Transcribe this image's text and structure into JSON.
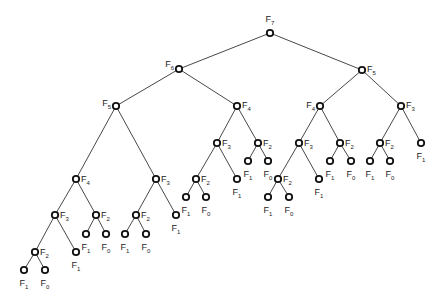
{
  "diagram": {
    "title": "",
    "type": "recursion-tree",
    "colors": {
      "edge": "#333333",
      "node_stroke": "#111111",
      "node_fill": "#ffffff",
      "label": "#222222"
    },
    "nodes": [
      {
        "id": "n0",
        "label": "F",
        "sub": "7",
        "x": 270,
        "y": 33,
        "lx": 270,
        "ly": 22,
        "anchor": "middle"
      },
      {
        "id": "n1",
        "label": "F",
        "sub": "6",
        "x": 179,
        "y": 69,
        "lx": 174,
        "ly": 67,
        "anchor": "end"
      },
      {
        "id": "n2",
        "label": "F",
        "sub": "5",
        "x": 362,
        "y": 70,
        "lx": 367,
        "ly": 72,
        "anchor": "start"
      },
      {
        "id": "n3",
        "label": "F",
        "sub": "5",
        "x": 116,
        "y": 106,
        "lx": 111,
        "ly": 106,
        "anchor": "end"
      },
      {
        "id": "n4",
        "label": "F",
        "sub": "4",
        "x": 237,
        "y": 106,
        "lx": 242,
        "ly": 108,
        "anchor": "start"
      },
      {
        "id": "n5",
        "label": "F",
        "sub": "4",
        "x": 320,
        "y": 106,
        "lx": 315,
        "ly": 108,
        "anchor": "end"
      },
      {
        "id": "n6",
        "label": "F",
        "sub": "3",
        "x": 401,
        "y": 106,
        "lx": 406,
        "ly": 108,
        "anchor": "start"
      },
      {
        "id": "n7",
        "label": "F",
        "sub": "4",
        "x": 76,
        "y": 179,
        "lx": 81,
        "ly": 182,
        "anchor": "start"
      },
      {
        "id": "n8",
        "label": "F",
        "sub": "3",
        "x": 156,
        "y": 179,
        "lx": 161,
        "ly": 182,
        "anchor": "start"
      },
      {
        "id": "n9",
        "label": "F",
        "sub": "3",
        "x": 217,
        "y": 143,
        "lx": 222,
        "ly": 146,
        "anchor": "start"
      },
      {
        "id": "n10",
        "label": "F",
        "sub": "2",
        "x": 258,
        "y": 143,
        "lx": 263,
        "ly": 146,
        "anchor": "start"
      },
      {
        "id": "n11",
        "label": "F",
        "sub": "3",
        "x": 299,
        "y": 143,
        "lx": 304,
        "ly": 146,
        "anchor": "start"
      },
      {
        "id": "n12",
        "label": "F",
        "sub": "2",
        "x": 340,
        "y": 143,
        "lx": 345,
        "ly": 146,
        "anchor": "start"
      },
      {
        "id": "n13",
        "label": "F",
        "sub": "2",
        "x": 380,
        "y": 143,
        "lx": 385,
        "ly": 146,
        "anchor": "start"
      },
      {
        "id": "n14",
        "label": "F",
        "sub": "1",
        "x": 421,
        "y": 143,
        "lx": 421,
        "ly": 159,
        "anchor": "middle"
      },
      {
        "id": "n15",
        "label": "F",
        "sub": "3",
        "x": 55,
        "y": 215,
        "lx": 60,
        "ly": 218,
        "anchor": "start"
      },
      {
        "id": "n16",
        "label": "F",
        "sub": "2",
        "x": 96,
        "y": 215,
        "lx": 101,
        "ly": 218,
        "anchor": "start"
      },
      {
        "id": "n17",
        "label": "F",
        "sub": "2",
        "x": 136,
        "y": 215,
        "lx": 141,
        "ly": 218,
        "anchor": "start"
      },
      {
        "id": "n18",
        "label": "F",
        "sub": "1",
        "x": 176,
        "y": 215,
        "lx": 176,
        "ly": 231,
        "anchor": "middle"
      },
      {
        "id": "n19",
        "label": "F",
        "sub": "2",
        "x": 196,
        "y": 179,
        "lx": 201,
        "ly": 182,
        "anchor": "start"
      },
      {
        "id": "n20",
        "label": "F",
        "sub": "1",
        "x": 237,
        "y": 179,
        "lx": 237,
        "ly": 195,
        "anchor": "middle"
      },
      {
        "id": "n21",
        "label": "F",
        "sub": "1",
        "x": 248,
        "y": 161,
        "lx": 248,
        "ly": 177,
        "anchor": "middle"
      },
      {
        "id": "n22",
        "label": "F",
        "sub": "0",
        "x": 268,
        "y": 161,
        "lx": 268,
        "ly": 177,
        "anchor": "middle"
      },
      {
        "id": "n23",
        "label": "F",
        "sub": "2",
        "x": 278,
        "y": 179,
        "lx": 283,
        "ly": 182,
        "anchor": "start"
      },
      {
        "id": "n24",
        "label": "F",
        "sub": "1",
        "x": 319,
        "y": 179,
        "lx": 319,
        "ly": 195,
        "anchor": "middle"
      },
      {
        "id": "n25",
        "label": "F",
        "sub": "1",
        "x": 330,
        "y": 161,
        "lx": 330,
        "ly": 177,
        "anchor": "middle"
      },
      {
        "id": "n26",
        "label": "F",
        "sub": "0",
        "x": 351,
        "y": 161,
        "lx": 351,
        "ly": 177,
        "anchor": "middle"
      },
      {
        "id": "n27",
        "label": "F",
        "sub": "1",
        "x": 370,
        "y": 161,
        "lx": 370,
        "ly": 177,
        "anchor": "middle"
      },
      {
        "id": "n28",
        "label": "F",
        "sub": "0",
        "x": 390,
        "y": 161,
        "lx": 390,
        "ly": 177,
        "anchor": "middle"
      },
      {
        "id": "n29",
        "label": "F",
        "sub": "2",
        "x": 35,
        "y": 252,
        "lx": 40,
        "ly": 255,
        "anchor": "start"
      },
      {
        "id": "n30",
        "label": "F",
        "sub": "1",
        "x": 76,
        "y": 252,
        "lx": 76,
        "ly": 268,
        "anchor": "middle"
      },
      {
        "id": "n31",
        "label": "F",
        "sub": "1",
        "x": 86,
        "y": 234,
        "lx": 86,
        "ly": 250,
        "anchor": "middle"
      },
      {
        "id": "n32",
        "label": "F",
        "sub": "0",
        "x": 106,
        "y": 234,
        "lx": 106,
        "ly": 250,
        "anchor": "middle"
      },
      {
        "id": "n33",
        "label": "F",
        "sub": "1",
        "x": 125,
        "y": 234,
        "lx": 125,
        "ly": 250,
        "anchor": "middle"
      },
      {
        "id": "n34",
        "label": "F",
        "sub": "0",
        "x": 146,
        "y": 234,
        "lx": 146,
        "ly": 250,
        "anchor": "middle"
      },
      {
        "id": "n35",
        "label": "F",
        "sub": "1",
        "x": 186,
        "y": 197,
        "lx": 186,
        "ly": 213,
        "anchor": "middle"
      },
      {
        "id": "n36",
        "label": "F",
        "sub": "0",
        "x": 206,
        "y": 197,
        "lx": 206,
        "ly": 213,
        "anchor": "middle"
      },
      {
        "id": "n37",
        "label": "F",
        "sub": "1",
        "x": 268,
        "y": 197,
        "lx": 268,
        "ly": 213,
        "anchor": "middle"
      },
      {
        "id": "n38",
        "label": "F",
        "sub": "0",
        "x": 289,
        "y": 197,
        "lx": 289,
        "ly": 213,
        "anchor": "middle"
      },
      {
        "id": "n39",
        "label": "F",
        "sub": "1",
        "x": 24,
        "y": 270,
        "lx": 24,
        "ly": 286,
        "anchor": "middle"
      },
      {
        "id": "n40",
        "label": "F",
        "sub": "0",
        "x": 45,
        "y": 270,
        "lx": 45,
        "ly": 286,
        "anchor": "middle"
      }
    ],
    "edges": [
      [
        "n0",
        "n1"
      ],
      [
        "n0",
        "n2"
      ],
      [
        "n1",
        "n3"
      ],
      [
        "n1",
        "n4"
      ],
      [
        "n2",
        "n5"
      ],
      [
        "n2",
        "n6"
      ],
      [
        "n3",
        "n7"
      ],
      [
        "n3",
        "n8"
      ],
      [
        "n4",
        "n9"
      ],
      [
        "n4",
        "n10"
      ],
      [
        "n5",
        "n11"
      ],
      [
        "n5",
        "n12"
      ],
      [
        "n6",
        "n13"
      ],
      [
        "n6",
        "n14"
      ],
      [
        "n7",
        "n15"
      ],
      [
        "n7",
        "n16"
      ],
      [
        "n8",
        "n17"
      ],
      [
        "n8",
        "n18"
      ],
      [
        "n9",
        "n19"
      ],
      [
        "n9",
        "n20"
      ],
      [
        "n10",
        "n21"
      ],
      [
        "n10",
        "n22"
      ],
      [
        "n11",
        "n23"
      ],
      [
        "n11",
        "n24"
      ],
      [
        "n12",
        "n25"
      ],
      [
        "n12",
        "n26"
      ],
      [
        "n13",
        "n27"
      ],
      [
        "n13",
        "n28"
      ],
      [
        "n15",
        "n29"
      ],
      [
        "n15",
        "n30"
      ],
      [
        "n16",
        "n31"
      ],
      [
        "n16",
        "n32"
      ],
      [
        "n17",
        "n33"
      ],
      [
        "n17",
        "n34"
      ],
      [
        "n19",
        "n35"
      ],
      [
        "n19",
        "n36"
      ],
      [
        "n23",
        "n37"
      ],
      [
        "n23",
        "n38"
      ],
      [
        "n29",
        "n39"
      ],
      [
        "n29",
        "n40"
      ]
    ]
  }
}
